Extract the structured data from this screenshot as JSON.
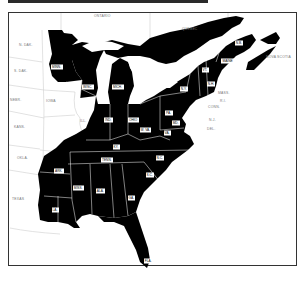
{
  "map": {
    "description": "Eastern United States with highlighted states in black",
    "highlight_color": "#000000",
    "background_color": "#ffffff",
    "border_line_color": "#cfcfcf",
    "outside_labels": [
      {
        "id": "ontario",
        "text": "ONTARIO",
        "x": 100,
        "y": 16
      },
      {
        "id": "quebec",
        "text": "QUEBEC",
        "x": 186,
        "y": 29
      },
      {
        "id": "n-dak",
        "text": "N. DAK.",
        "x": 22,
        "y": 45
      },
      {
        "id": "s-dak",
        "text": "S. DAK.",
        "x": 18,
        "y": 71
      },
      {
        "id": "nebr",
        "text": "NEBR.",
        "x": 12,
        "y": 100
      },
      {
        "id": "iowa",
        "text": "IOWA",
        "x": 48,
        "y": 101
      },
      {
        "id": "ill",
        "text": "ILL.",
        "x": 82,
        "y": 121
      },
      {
        "id": "kans",
        "text": "KANS.",
        "x": 16,
        "y": 127
      },
      {
        "id": "okla",
        "text": "OKLA.",
        "x": 20,
        "y": 158
      },
      {
        "id": "texas",
        "text": "TEXAS",
        "x": 15,
        "y": 199
      },
      {
        "id": "nova-scotia",
        "text": "NOVA SCOTIA",
        "x": 274,
        "y": 57
      },
      {
        "id": "mass",
        "text": "MASS.",
        "x": 222,
        "y": 93
      },
      {
        "id": "r-i",
        "text": "R.I.",
        "x": 222,
        "y": 101
      },
      {
        "id": "conn",
        "text": "CONN.",
        "x": 212,
        "y": 107
      },
      {
        "id": "n-j",
        "text": "N.J.",
        "x": 212,
        "y": 120
      },
      {
        "id": "del",
        "text": "DEL.",
        "x": 210,
        "y": 129
      }
    ],
    "state_labels": [
      {
        "id": "minn",
        "text": "MINN.",
        "x": 57,
        "y": 68
      },
      {
        "id": "wisc",
        "text": "WISC.",
        "x": 88,
        "y": 88
      },
      {
        "id": "mich",
        "text": "MICH.",
        "x": 118,
        "y": 88
      },
      {
        "id": "ind",
        "text": "IND.",
        "x": 108,
        "y": 121
      },
      {
        "id": "ohio",
        "text": "OHIO",
        "x": 133,
        "y": 121
      },
      {
        "id": "pa",
        "text": "PA.",
        "x": 168,
        "y": 114
      },
      {
        "id": "n-y",
        "text": "N.Y.",
        "x": 183,
        "y": 90
      },
      {
        "id": "vt",
        "text": "VT.",
        "x": 205,
        "y": 71
      },
      {
        "id": "n-h",
        "text": "N.H.",
        "x": 210,
        "y": 85
      },
      {
        "id": "maine",
        "text": "MAINE",
        "x": 227,
        "y": 62
      },
      {
        "id": "n-b",
        "text": "N.B.",
        "x": 238,
        "y": 44
      },
      {
        "id": "w-va",
        "text": "W. VA.",
        "x": 145,
        "y": 131
      },
      {
        "id": "va",
        "text": "VA.",
        "x": 167,
        "y": 134
      },
      {
        "id": "md",
        "text": "MD.",
        "x": 175,
        "y": 124
      },
      {
        "id": "ky",
        "text": "KY.",
        "x": 116,
        "y": 148
      },
      {
        "id": "tenn",
        "text": "TENN.",
        "x": 107,
        "y": 161
      },
      {
        "id": "n-c",
        "text": "N.C.",
        "x": 159,
        "y": 159
      },
      {
        "id": "s-c",
        "text": "S.C.",
        "x": 149,
        "y": 176
      },
      {
        "id": "ark",
        "text": "ARK.",
        "x": 58,
        "y": 172
      },
      {
        "id": "miss",
        "text": "MISS.",
        "x": 78,
        "y": 189
      },
      {
        "id": "ala",
        "text": "ALA.",
        "x": 100,
        "y": 192
      },
      {
        "id": "ga",
        "text": "GA.",
        "x": 131,
        "y": 199
      },
      {
        "id": "la",
        "text": "LA.",
        "x": 55,
        "y": 211
      },
      {
        "id": "fla",
        "text": "FLA.",
        "x": 148,
        "y": 262
      }
    ]
  }
}
